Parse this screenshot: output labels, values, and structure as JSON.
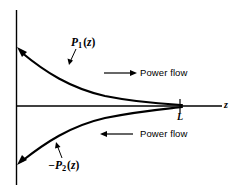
{
  "figure": {
    "background_color": "#ffffff",
    "line_color": "#000000",
    "width": 236,
    "height": 189
  },
  "axes": {
    "vertical_axis": {
      "name": "power-axis",
      "x": 16,
      "y_top": 10,
      "y_bottom": 185
    },
    "horizontal_axis": {
      "name": "z-axis",
      "y": 106,
      "x_left": 16,
      "x_right": 222,
      "label": "z"
    },
    "ticks": [
      {
        "label": "L",
        "x": 180,
        "axis": "z"
      }
    ]
  },
  "curves": [
    {
      "name": "p1-curve",
      "label": "P",
      "label_subscript": "1",
      "label_argument": "(z)",
      "description": "decaying exponential above axis from left axis to L",
      "arrowhead": "upper-left"
    },
    {
      "name": "p2-curve",
      "label": "−P",
      "label_subscript": "2",
      "label_argument": "(z)",
      "description": "growing-magnitude negative exponential below axis from L to left axis",
      "arrowhead": "lower-left"
    }
  ],
  "annotations": [
    {
      "name": "power-flow-forward",
      "text": "Power flow",
      "arrow_direction": "right",
      "region": "upper"
    },
    {
      "name": "power-flow-backward",
      "text": "Power flow",
      "arrow_direction": "left",
      "region": "lower"
    }
  ]
}
